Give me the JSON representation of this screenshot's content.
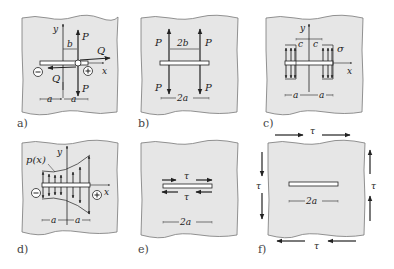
{
  "figure": {
    "colors": {
      "plate_fill": "#e6e6e6",
      "plate_edge": "#777777",
      "ink": "#222222"
    },
    "panels": [
      {
        "id": "a",
        "label": "a)",
        "symbols": {
          "y": "y",
          "x": "x",
          "b": "b",
          "P_top": "P",
          "P_bottom": "P",
          "Q_top": "Q",
          "Q_bottom": "Q",
          "minus": "−",
          "plus": "+",
          "a_left": "a",
          "a_right": "a"
        }
      },
      {
        "id": "b",
        "label": "b)",
        "symbols": {
          "P_tl": "P",
          "P_tr": "P",
          "P_bl": "P",
          "P_br": "P",
          "spacing": "2b",
          "length": "2a"
        }
      },
      {
        "id": "c",
        "label": "c)",
        "symbols": {
          "y": "y",
          "x": "x",
          "c_left": "c",
          "c_right": "c",
          "sigma": "σ",
          "a_left": "a",
          "a_right": "a"
        }
      },
      {
        "id": "d",
        "label": "d)",
        "symbols": {
          "p": "p(x)",
          "y": "y",
          "x": "x",
          "minus": "−",
          "plus": "+",
          "a_left": "a",
          "a_right": "a"
        }
      },
      {
        "id": "e",
        "label": "e)",
        "symbols": {
          "tau_top": "τ",
          "tau_bottom": "τ",
          "length": "2a"
        }
      },
      {
        "id": "f",
        "label": "f)",
        "symbols": {
          "tau_top": "τ",
          "tau_bottom": "τ",
          "tau_left": "τ",
          "tau_right": "τ",
          "length": "2a"
        }
      }
    ]
  }
}
